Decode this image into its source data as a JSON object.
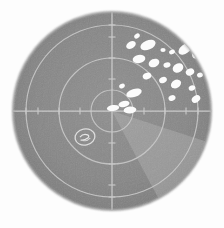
{
  "display": {
    "kind": "radar-ppi-scope",
    "title": "Radar PPI Scope",
    "image_width": 224,
    "image_height": 228,
    "background_color": "#fdfdfd",
    "scope_face_color": "#868686",
    "scope_edge_color": "#6f6f6f",
    "graticule_color": "#c9c9c9",
    "echo_color": "#fbfbfb",
    "sweep_color": "#b4b4b4",
    "marker_color": "#e0e0e0"
  },
  "scope": {
    "center_x": 112,
    "center_y": 111,
    "radius": 99,
    "range_rings": [
      {
        "label": "inner-ring",
        "radius": 21
      },
      {
        "label": "middle-ring",
        "radius": 53
      },
      {
        "label": "outer-ring",
        "radius": 86
      }
    ],
    "axes": {
      "horizontal": {
        "x1": 13,
        "y1": 111,
        "x2": 211,
        "y2": 111
      },
      "vertical": {
        "x1": 112,
        "y1": 12,
        "x2": 112,
        "y2": 210
      },
      "tick_length": 7,
      "tick_offsets": [
        32,
        53,
        74,
        86
      ],
      "tick_count": 16
    }
  },
  "sweep": {
    "name": "sweep-wedge",
    "start_angle_deg": 108,
    "end_angle_deg": 152,
    "radius": 99,
    "opacity": 0.42
  },
  "echoes": {
    "count": 24,
    "blobs": [
      {
        "cx": 137,
        "cy": 36,
        "rx": 3.0,
        "ry": 2.2,
        "rot": -35
      },
      {
        "cx": 131,
        "cy": 45,
        "rx": 5.2,
        "ry": 3.4,
        "rot": -30
      },
      {
        "cx": 148,
        "cy": 45,
        "rx": 8.0,
        "ry": 4.6,
        "rot": -22
      },
      {
        "cx": 163,
        "cy": 50,
        "rx": 2.6,
        "ry": 2.0,
        "rot": 0
      },
      {
        "cx": 172,
        "cy": 52,
        "rx": 3.0,
        "ry": 2.2,
        "rot": -20
      },
      {
        "cx": 185,
        "cy": 49,
        "rx": 7.5,
        "ry": 4.4,
        "rot": -38
      },
      {
        "cx": 196,
        "cy": 55,
        "rx": 4.0,
        "ry": 3.4,
        "rot": -20
      },
      {
        "cx": 139,
        "cy": 59,
        "rx": 6.4,
        "ry": 4.2,
        "rot": -12
      },
      {
        "cx": 154,
        "cy": 63,
        "rx": 5.6,
        "ry": 4.0,
        "rot": -25
      },
      {
        "cx": 167,
        "cy": 65,
        "rx": 3.6,
        "ry": 2.6,
        "rot": -15
      },
      {
        "cx": 178,
        "cy": 68,
        "rx": 5.6,
        "ry": 4.4,
        "rot": -30
      },
      {
        "cx": 190,
        "cy": 72,
        "rx": 4.4,
        "ry": 3.4,
        "rot": -28
      },
      {
        "cx": 200,
        "cy": 75,
        "rx": 3.0,
        "ry": 2.4,
        "rot": -20
      },
      {
        "cx": 147,
        "cy": 76,
        "rx": 4.4,
        "ry": 3.2,
        "rot": -20
      },
      {
        "cx": 163,
        "cy": 80,
        "rx": 4.0,
        "ry": 3.0,
        "rot": -25
      },
      {
        "cx": 176,
        "cy": 84,
        "rx": 5.4,
        "ry": 4.0,
        "rot": -30
      },
      {
        "cx": 192,
        "cy": 88,
        "rx": 3.4,
        "ry": 2.6,
        "rot": -20
      },
      {
        "cx": 172,
        "cy": 98,
        "rx": 3.6,
        "ry": 2.8,
        "rot": -25
      },
      {
        "cx": 196,
        "cy": 99,
        "rx": 4.6,
        "ry": 3.4,
        "rot": -35
      },
      {
        "cx": 134,
        "cy": 93,
        "rx": 8.0,
        "ry": 4.0,
        "rot": -18
      },
      {
        "cx": 124,
        "cy": 104,
        "rx": 5.6,
        "ry": 3.0,
        "rot": -12
      },
      {
        "cx": 113,
        "cy": 108,
        "rx": 6.2,
        "ry": 3.0,
        "rot": -8
      },
      {
        "cx": 130,
        "cy": 110,
        "rx": 6.4,
        "ry": 3.4,
        "rot": -6
      },
      {
        "cx": 122,
        "cy": 86,
        "rx": 3.0,
        "ry": 2.2,
        "rot": -30
      }
    ]
  },
  "marker": {
    "name": "target-annotation-marker",
    "cx": 85,
    "cy": 137,
    "rx": 10,
    "ry": 8,
    "rotation_deg": -12,
    "inner_glyph": "swirl"
  }
}
